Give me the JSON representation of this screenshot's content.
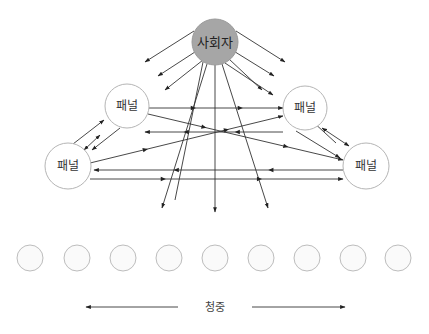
{
  "diagram": {
    "type": "panel-discussion-communication-flow",
    "moderator": {
      "label": "사회자",
      "cx": 215,
      "cy": 42,
      "r": 23,
      "fill": "#a6a6a6"
    },
    "panels": [
      {
        "id": "panel-top-left",
        "label": "패널",
        "cx": 127,
        "cy": 106,
        "r": 22
      },
      {
        "id": "panel-top-right",
        "label": "패널",
        "cx": 305,
        "cy": 108,
        "r": 22
      },
      {
        "id": "panel-bottom-left",
        "label": "패널",
        "cx": 68,
        "cy": 166,
        "r": 23
      },
      {
        "id": "panel-bottom-right",
        "label": "패널",
        "cx": 366,
        "cy": 166,
        "r": 23
      }
    ],
    "audience": {
      "label": "청중",
      "cy": 258,
      "r": 13,
      "xs": [
        30,
        77,
        123,
        169,
        215,
        261,
        307,
        353,
        398
      ]
    },
    "audience_arrow": {
      "y": 307,
      "left": {
        "x1": 178,
        "x2": 86
      },
      "right": {
        "x1": 252,
        "x2": 345
      }
    },
    "colors": {
      "line": "#333333",
      "node_stroke": "#b5b5b5",
      "node_fill": "#ffffff",
      "audience_fill": "#fafafa"
    }
  }
}
